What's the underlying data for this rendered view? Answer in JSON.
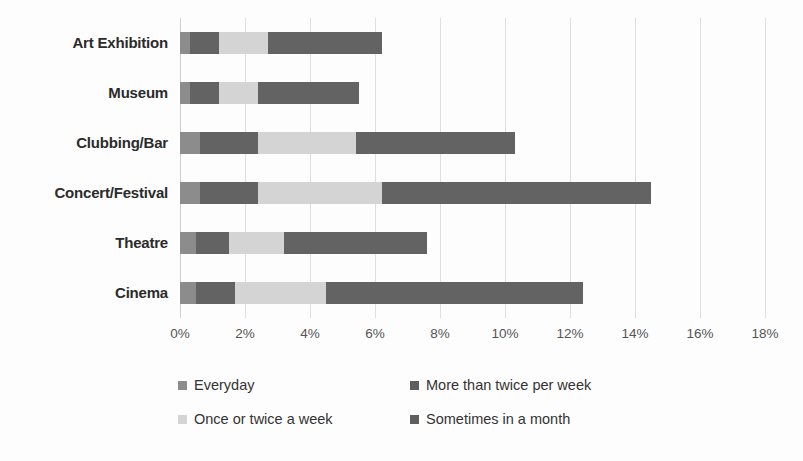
{
  "chart_data": {
    "type": "bar",
    "orientation": "horizontal",
    "stacked": true,
    "title": "",
    "xlabel": "",
    "ylabel": "",
    "xlim": [
      0,
      18
    ],
    "xtick_step": 2,
    "xtick_labels": [
      "0%",
      "2%",
      "4%",
      "6%",
      "8%",
      "10%",
      "12%",
      "14%",
      "16%",
      "18%"
    ],
    "xtick_values": [
      0,
      2,
      4,
      6,
      8,
      10,
      12,
      14,
      16,
      18
    ],
    "grid": true,
    "legend_position": "bottom-left",
    "categories": [
      "Art Exhibition",
      "Museum",
      "Clubbing/Bar",
      "Concert/Festival",
      "Theatre",
      "Cinema"
    ],
    "series": [
      {
        "name": "Everyday",
        "color": "#8c8c8c",
        "values": [
          0.3,
          0.3,
          0.6,
          0.6,
          0.5,
          0.5
        ]
      },
      {
        "name": "More than twice per week",
        "color": "#636363",
        "values": [
          0.9,
          0.9,
          1.8,
          1.8,
          1.0,
          1.2
        ]
      },
      {
        "name": "Once or twice a week",
        "color": "#d4d4d4",
        "values": [
          1.5,
          1.2,
          3.0,
          3.8,
          1.7,
          2.8
        ]
      },
      {
        "name": "Sometimes in a month",
        "color": "#636363",
        "values": [
          3.5,
          3.1,
          4.9,
          8.3,
          4.4,
          7.9
        ]
      }
    ],
    "totals": [
      6.2,
      5.5,
      10.3,
      14.5,
      7.6,
      12.4
    ],
    "annotations": []
  },
  "legend": {
    "items": [
      {
        "label": "Everyday",
        "color": "#8c8c8c"
      },
      {
        "label": "More than twice per week",
        "color": "#5e5e5e"
      },
      {
        "label": "Once or twice a week",
        "color": "#d4d4d4"
      },
      {
        "label": "Sometimes in a month",
        "color": "#5e5e5e"
      }
    ]
  }
}
